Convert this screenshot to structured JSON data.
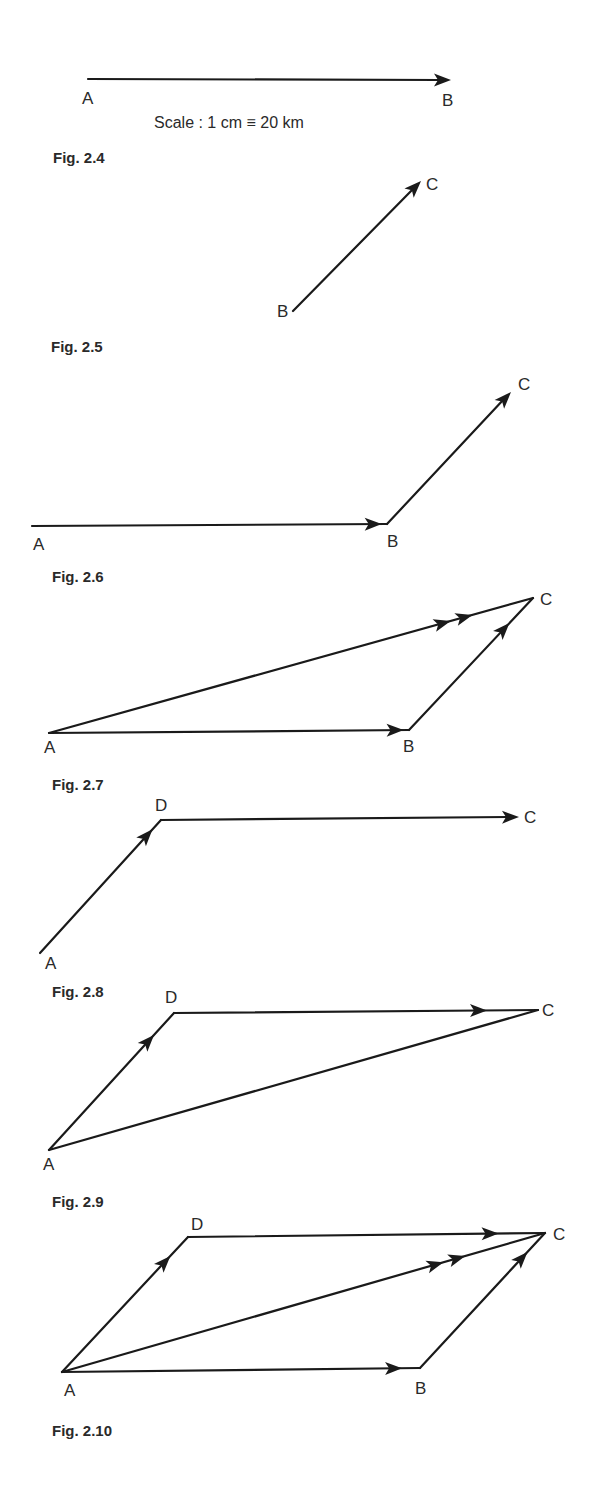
{
  "scale_text": "Scale : 1 cm ≡ 20 km",
  "figures": [
    {
      "caption": "Fig. 2.4",
      "points": {
        "A": "start",
        "B": "end"
      },
      "vectors": [
        {
          "from": "A",
          "to": "B",
          "arrows": 1
        }
      ],
      "labels": [
        "A",
        "B"
      ]
    },
    {
      "caption": "Fig. 2.5",
      "vectors": [
        {
          "from": "B",
          "to": "C",
          "arrows": 1
        }
      ],
      "labels": [
        "B",
        "C"
      ]
    },
    {
      "caption": "Fig. 2.6",
      "vectors": [
        {
          "from": "A",
          "to": "B",
          "arrows": 1
        },
        {
          "from": "B",
          "to": "C",
          "arrows": 1
        }
      ],
      "labels": [
        "A",
        "B",
        "C"
      ]
    },
    {
      "caption": "Fig. 2.7",
      "vectors": [
        {
          "from": "A",
          "to": "B",
          "arrows": 1
        },
        {
          "from": "B",
          "to": "C",
          "arrows": 1
        },
        {
          "from": "A",
          "to": "C",
          "arrows": 2
        }
      ],
      "labels": [
        "A",
        "B",
        "C"
      ]
    },
    {
      "caption": "Fig. 2.8",
      "vectors": [
        {
          "from": "A",
          "to": "D",
          "arrows": 1
        },
        {
          "from": "D",
          "to": "C",
          "arrows": 1
        }
      ],
      "labels": [
        "A",
        "D",
        "C"
      ]
    },
    {
      "caption": "Fig. 2.9",
      "vectors": [
        {
          "from": "A",
          "to": "D",
          "arrows": 1
        },
        {
          "from": "D",
          "to": "C",
          "arrows": 1
        },
        {
          "from": "A",
          "to": "C",
          "arrows": 0
        }
      ],
      "labels": [
        "A",
        "D",
        "C"
      ]
    },
    {
      "caption": "Fig. 2.10",
      "vectors": [
        {
          "from": "A",
          "to": "D",
          "arrows": 1
        },
        {
          "from": "D",
          "to": "C",
          "arrows": 1
        },
        {
          "from": "A",
          "to": "B",
          "arrows": 1
        },
        {
          "from": "B",
          "to": "C",
          "arrows": 1
        },
        {
          "from": "A",
          "to": "C",
          "arrows": 2
        }
      ],
      "labels": [
        "A",
        "B",
        "C",
        "D"
      ]
    }
  ]
}
